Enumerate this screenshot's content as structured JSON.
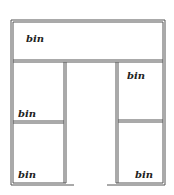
{
  "diagram": {
    "title": "",
    "bins": [
      {
        "id": "top",
        "label": "bin"
      },
      {
        "id": "right-upper",
        "label": "bin"
      },
      {
        "id": "left-upper",
        "label": "bin"
      },
      {
        "id": "left-lower",
        "label": "bin"
      },
      {
        "id": "right-lower",
        "label": "bin"
      }
    ],
    "colors": {
      "line": "#555555",
      "text": "#222222",
      "background": "#ffffff"
    }
  }
}
